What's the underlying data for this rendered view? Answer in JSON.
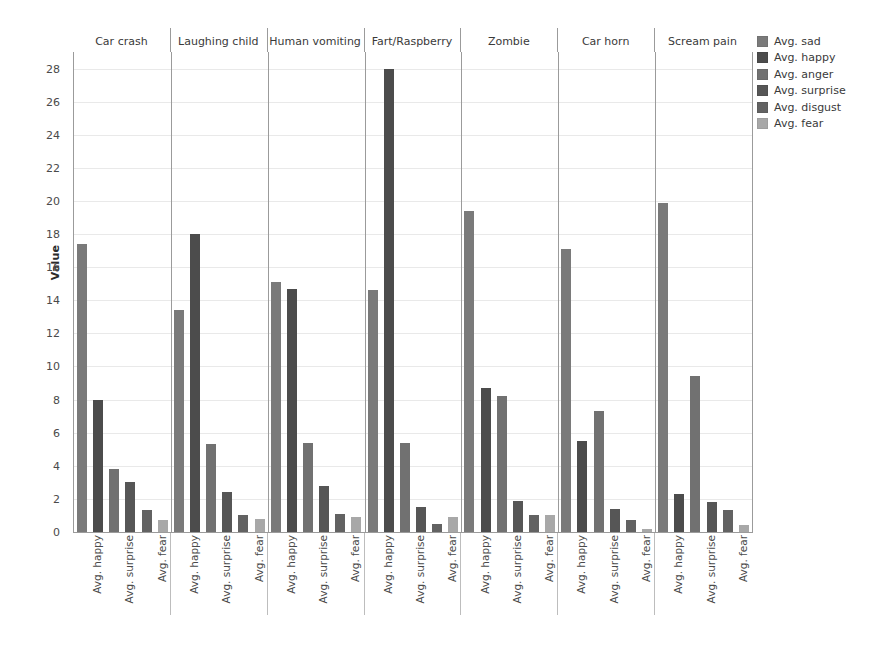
{
  "chart_data": {
    "type": "bar",
    "title": "",
    "subtitle": "",
    "xlabel": "",
    "ylabel": "Value",
    "ylim": [
      0,
      29
    ],
    "yticks": [
      0,
      2,
      4,
      6,
      8,
      10,
      12,
      14,
      16,
      18,
      20,
      22,
      24,
      26,
      28
    ],
    "grid": true,
    "legend_position": "right",
    "facet_layout": "columns",
    "categories": [
      "Avg. sad",
      "Avg. happy",
      "Avg. anger",
      "Avg. surprise",
      "Avg. disgust",
      "Avg. fear"
    ],
    "visible_xticklabels": [
      "Avg. happy",
      "Avg. surprise",
      "Avg. fear"
    ],
    "facets": [
      {
        "name": "Car crash",
        "values": [
          17.4,
          8.0,
          3.8,
          3.0,
          1.3,
          0.7
        ]
      },
      {
        "name": "Laughing child",
        "values": [
          13.4,
          18.0,
          5.3,
          2.4,
          1.0,
          0.8
        ]
      },
      {
        "name": "Human vomiting",
        "values": [
          15.1,
          14.7,
          5.4,
          2.8,
          1.1,
          0.9
        ]
      },
      {
        "name": "Fart/Raspberry",
        "values": [
          14.6,
          28.0,
          5.4,
          1.5,
          0.5,
          0.9
        ]
      },
      {
        "name": "Zombie",
        "values": [
          19.4,
          8.7,
          8.2,
          1.9,
          1.0,
          1.0
        ]
      },
      {
        "name": "Car horn",
        "values": [
          17.1,
          5.5,
          7.3,
          1.4,
          0.7,
          0.2
        ]
      },
      {
        "name": "Scream pain",
        "values": [
          19.9,
          2.3,
          9.4,
          1.8,
          1.3,
          0.4
        ]
      }
    ],
    "series_colors": [
      "#7a7a7a",
      "#4c4c4c",
      "#717171",
      "#565656",
      "#626262",
      "#a8a8a8"
    ]
  },
  "legend": {
    "items": [
      {
        "label": "Avg. sad",
        "color": "#7a7a7a"
      },
      {
        "label": "Avg. happy",
        "color": "#4c4c4c"
      },
      {
        "label": "Avg. anger",
        "color": "#717171"
      },
      {
        "label": "Avg. surprise",
        "color": "#565656"
      },
      {
        "label": "Avg. disgust",
        "color": "#626262"
      },
      {
        "label": "Avg. fear",
        "color": "#a8a8a8"
      }
    ]
  },
  "axes": {
    "y_title": "Value"
  }
}
